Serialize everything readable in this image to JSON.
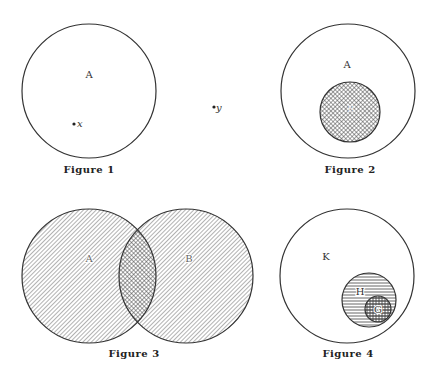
{
  "figures": [
    {
      "caption": "Figure 1",
      "circles": [
        {
          "label": "A",
          "cx": 89,
          "cy": 91,
          "r": 67,
          "fill": "none"
        }
      ],
      "points": [
        {
          "label": "x",
          "cx": 75,
          "cy": 124,
          "inside": "A"
        }
      ]
    },
    {
      "caption": "Figure 2",
      "circles": [
        {
          "label": "A",
          "cx": 348,
          "cy": 91,
          "r": 67,
          "fill": "none"
        },
        {
          "label": "B",
          "cx": 350,
          "cy": 112,
          "r": 30,
          "fill": "crosshatch"
        }
      ]
    },
    {
      "caption": "Figure 3",
      "circles": [
        {
          "label": "A",
          "cx": 89,
          "cy": 276,
          "r": 67,
          "fill": "diagonal-hatch"
        },
        {
          "label": "B",
          "cx": 186,
          "cy": 276,
          "r": 67,
          "fill": "diagonal-hatch"
        }
      ],
      "intersection_fill": "crosshatch"
    },
    {
      "caption": "Figure 4",
      "circles": [
        {
          "label": "K",
          "cx": 347,
          "cy": 276,
          "r": 67,
          "fill": "none"
        },
        {
          "label": "H",
          "cx": 369,
          "cy": 300,
          "r": 27,
          "fill": "horizontal-hatch"
        },
        {
          "label": "G",
          "cx": 378,
          "cy": 309,
          "r": 13,
          "fill": "grid-hatch"
        }
      ]
    }
  ],
  "outside_points": [
    {
      "label": "y",
      "cx": 215,
      "cy": 107
    }
  ],
  "labels": {
    "f1_A": "A",
    "f1_x": "x",
    "y": "y",
    "f2_A": "A",
    "f2_B": "B",
    "f3_A": "A",
    "f3_B": "B",
    "f4_K": "K",
    "f4_H": "H",
    "f4_G": "G"
  },
  "captions": {
    "fig1": "Figure 1",
    "fig2": "Figure 2",
    "fig3": "Figure 3",
    "fig4": "Figure 4"
  },
  "colors": {
    "stroke": "#333333",
    "hatch": "#555555",
    "background": "#ffffff"
  }
}
